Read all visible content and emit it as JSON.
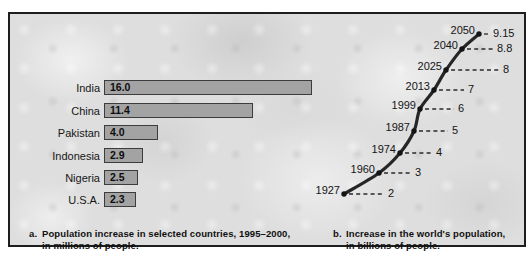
{
  "figure": {
    "caption_a": {
      "marker": "a.",
      "line1": "Population increase in selected countries, 1995–2000,",
      "line2": "in millions of people."
    },
    "caption_b": {
      "marker": "b.",
      "line1": "Increase in the world's population,",
      "line2": "in billions of people."
    }
  },
  "chart_data": [
    {
      "type": "bar",
      "orientation": "horizontal",
      "title": "Population increase in selected countries, 1995–2000, in millions of people",
      "categories": [
        "India",
        "China",
        "Pakistan",
        "Indonesia",
        "Nigeria",
        "U.S.A."
      ],
      "values": [
        16.0,
        11.4,
        4.0,
        2.9,
        2.5,
        2.3
      ],
      "value_labels": [
        "16.0",
        "11.4",
        "4.0",
        "2.9",
        "2.5",
        "2.3"
      ],
      "unit": "millions of people",
      "value_label_position": "inside-left",
      "grid": false
    },
    {
      "type": "line",
      "title": "Increase in the world's population, in billions of people",
      "x": [
        1927,
        1960,
        1974,
        1987,
        1999,
        2013,
        2025,
        2040,
        2050
      ],
      "x_labels": [
        "1927",
        "1960",
        "1974",
        "1987",
        "1999",
        "2013",
        "2025",
        "2040",
        "2050"
      ],
      "values": [
        2,
        3,
        4,
        5,
        6,
        7,
        8,
        8.8,
        9.15
      ],
      "value_labels": [
        "2",
        "3",
        "4",
        "5",
        "6",
        "7",
        "8",
        "8.8",
        "9.15"
      ],
      "unit": "billions of people",
      "annotation_style": "year left of point, dashed leader to value at right",
      "grid": false
    }
  ],
  "colors": {
    "frame_border": "#1e1e1e",
    "background": "#dedede",
    "bar_fill": "#a3a3a3",
    "bar_border": "#3c3c3c",
    "line": "#262626",
    "dot": "#141414",
    "text": "#111111",
    "page": "#ffffff"
  }
}
